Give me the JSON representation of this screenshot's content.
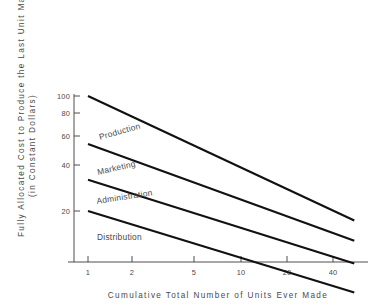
{
  "chart_data": {
    "type": "line",
    "title": "",
    "xlabel": "Cumulative  Total  Number  of  Units  Ever  Made",
    "ylabel_line1": "Fully  Allocated  Cost  to  Produce  the  Last  Unit  Made",
    "ylabel_line2": "(in  Constant  Dollars)",
    "xscale": "log",
    "yscale": "log",
    "xlim": [
      0.82,
      62
    ],
    "ylim": [
      4.2,
      118
    ],
    "grid": false,
    "legend": "inline-labels",
    "xticks": [
      1,
      2,
      5,
      10,
      20,
      40
    ],
    "xticklabels": [
      "1",
      "2",
      "5",
      "10",
      "20",
      "40"
    ],
    "yticks": [
      20,
      40,
      60,
      80,
      100
    ],
    "yticklabels": [
      "20",
      "40",
      "60",
      "80",
      "100"
    ],
    "x": [
      1,
      55
    ],
    "series": [
      {
        "name": "Production",
        "label": "Production",
        "values": [
          100,
          17.5
        ]
      },
      {
        "name": "Marketing",
        "label": "Marketing",
        "values": [
          51,
          13.2
        ]
      },
      {
        "name": "Administration",
        "label": "Administration",
        "values": [
          31,
          9.6
        ]
      },
      {
        "name": "Distribution",
        "label": "Distribution",
        "values": [
          20,
          6.4
        ]
      }
    ],
    "series_label_positions": [
      {
        "name": "Production",
        "x_px": 100,
        "y_px": 140,
        "rotation": -16
      },
      {
        "name": "Marketing",
        "x_px": 98,
        "y_px": 175,
        "rotation": -13
      },
      {
        "name": "Administration",
        "x_px": 97,
        "y_px": 204,
        "rotation": -9
      },
      {
        "name": "Distribution",
        "x_px": 97,
        "y_px": 240,
        "rotation": 0
      }
    ],
    "colors": {
      "background": "#ffffff",
      "line": "#111111",
      "axis": "#3a3a3a",
      "text": "#4a4a4a"
    }
  },
  "axes_geometry": {
    "x_px_at_1": 88,
    "x_px_at_2": 132,
    "x_px_at_5": 194,
    "x_px_at_10": 241,
    "x_px_at_20": 287,
    "x_px_at_40": 333,
    "x_px_right_end": 363,
    "y_px_at_100": 96,
    "y_px_at_80": 113,
    "y_px_at_60": 136,
    "y_px_at_40": 165,
    "y_px_at_20": 211,
    "y_axis_top_px": 94,
    "y_axis_bottom_px": 262,
    "x_axis_left_px": 68,
    "x_axis_right_px": 368,
    "x_axis_y_px": 262,
    "y_axis_x_px": 74
  }
}
